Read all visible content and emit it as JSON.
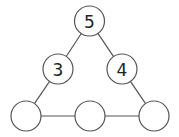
{
  "diagram": {
    "type": "number-triangle-puzzle",
    "nodes": [
      {
        "id": "top",
        "label": "5",
        "cx": 89.5,
        "cy": 21,
        "r": 15
      },
      {
        "id": "mid-left",
        "label": "3",
        "cx": 58,
        "cy": 69,
        "r": 15
      },
      {
        "id": "mid-right",
        "label": "4",
        "cx": 122,
        "cy": 69,
        "r": 15
      },
      {
        "id": "bottom-left",
        "label": "",
        "cx": 26,
        "cy": 116,
        "r": 15
      },
      {
        "id": "bottom-middle",
        "label": "",
        "cx": 90,
        "cy": 116,
        "r": 15
      },
      {
        "id": "bottom-right",
        "label": "",
        "cx": 154,
        "cy": 116,
        "r": 15
      }
    ],
    "edges": [
      [
        "top",
        "mid-left"
      ],
      [
        "top",
        "mid-right"
      ],
      [
        "mid-left",
        "bottom-left"
      ],
      [
        "mid-right",
        "bottom-right"
      ],
      [
        "bottom-left",
        "bottom-middle"
      ],
      [
        "bottom-middle",
        "bottom-right"
      ]
    ],
    "colors": {
      "stroke": "#555555",
      "text": "#222222",
      "background": "#ffffff"
    }
  }
}
